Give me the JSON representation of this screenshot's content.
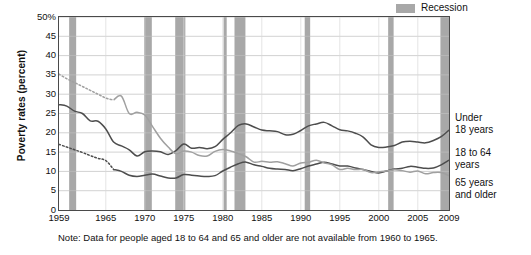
{
  "figure": {
    "y_axis_title": "Poverty rates (percent)",
    "footnote": "Note: Data for people aged 18 to 64 and 65 and older are not available from 1960 to 1965."
  },
  "legend": {
    "recession_label": "Recession",
    "recession_color": "#a8a8a8"
  },
  "series_labels": {
    "under18": "Under\n18 years",
    "age18to64": "18 to 64\nyears",
    "age65plus": "65 years\nand older"
  },
  "chart_data": {
    "type": "line",
    "title": "",
    "xlabel": "",
    "ylabel": "Poverty rates (percent)",
    "xlim": [
      1959,
      2009
    ],
    "ylim": [
      0,
      50
    ],
    "ytick_labels": [
      "0",
      "5",
      "10",
      "15",
      "20",
      "25",
      "30",
      "35",
      "40",
      "45",
      "50%"
    ],
    "ytick_values": [
      0,
      5,
      10,
      15,
      20,
      25,
      30,
      35,
      40,
      45,
      50
    ],
    "xtick_values": [
      1959,
      1965,
      1970,
      1975,
      1980,
      1985,
      1990,
      1995,
      2000,
      2005,
      2009
    ],
    "xtick_labels": [
      "1959",
      "1965",
      "1970",
      "1975",
      "1980",
      "1985",
      "1990",
      "1995",
      "2000",
      "2005",
      "2009"
    ],
    "grid": "horizontal",
    "legend_position": "top-right",
    "colors": {
      "under18": "#4d4d4d",
      "age18to64": "#4d4d4d",
      "age65plus": "#a0a0a0"
    },
    "series": [
      {
        "name": "Under 18 years",
        "color": "#4d4d4d",
        "style": "solid",
        "x": [
          1959,
          1960,
          1961,
          1962,
          1963,
          1964,
          1965,
          1966,
          1967,
          1968,
          1969,
          1970,
          1971,
          1972,
          1973,
          1974,
          1975,
          1976,
          1977,
          1978,
          1979,
          1980,
          1981,
          1982,
          1983,
          1984,
          1985,
          1986,
          1987,
          1988,
          1989,
          1990,
          1991,
          1992,
          1993,
          1994,
          1995,
          1996,
          1997,
          1998,
          1999,
          2000,
          2001,
          2002,
          2003,
          2004,
          2005,
          2006,
          2007,
          2008,
          2009
        ],
        "values": [
          27.3,
          26.9,
          25.6,
          25.0,
          23.1,
          23.0,
          21.0,
          17.6,
          16.6,
          15.6,
          14.0,
          15.1,
          15.3,
          15.1,
          14.4,
          15.4,
          17.1,
          16.0,
          16.2,
          15.9,
          16.4,
          18.3,
          20.0,
          21.9,
          22.3,
          21.5,
          20.7,
          20.5,
          20.3,
          19.5,
          19.6,
          20.6,
          21.8,
          22.3,
          22.7,
          21.8,
          20.8,
          20.5,
          19.9,
          18.9,
          16.9,
          16.2,
          16.3,
          16.7,
          17.6,
          17.8,
          17.6,
          17.4,
          18.0,
          19.0,
          20.7
        ]
      },
      {
        "name": "18 to 64 years",
        "color": "#4d4d4d",
        "style": "dotted-then-solid",
        "solid_from": 1966,
        "x": [
          1959,
          1960,
          1961,
          1962,
          1963,
          1964,
          1965,
          1966,
          1967,
          1968,
          1969,
          1970,
          1971,
          1972,
          1973,
          1974,
          1975,
          1976,
          1977,
          1978,
          1979,
          1980,
          1981,
          1982,
          1983,
          1984,
          1985,
          1986,
          1987,
          1988,
          1989,
          1990,
          1991,
          1992,
          1993,
          1994,
          1995,
          1996,
          1997,
          1998,
          1999,
          2000,
          2001,
          2002,
          2003,
          2004,
          2005,
          2006,
          2007,
          2008,
          2009
        ],
        "values": [
          17.0,
          16.3,
          15.6,
          14.9,
          14.1,
          13.4,
          12.8,
          10.5,
          10.0,
          9.0,
          8.7,
          9.0,
          9.3,
          8.8,
          8.3,
          8.3,
          9.2,
          9.0,
          8.8,
          8.7,
          8.9,
          10.1,
          11.1,
          12.0,
          12.4,
          11.7,
          11.3,
          10.8,
          10.6,
          10.5,
          10.2,
          10.7,
          11.4,
          11.9,
          12.4,
          11.9,
          11.4,
          11.4,
          10.9,
          10.5,
          10.0,
          9.6,
          10.1,
          10.6,
          10.8,
          11.3,
          11.1,
          10.8,
          10.9,
          11.7,
          12.9
        ]
      },
      {
        "name": "65 years and older",
        "color": "#a0a0a0",
        "style": "dotted-then-solid",
        "solid_from": 1966,
        "x": [
          1959,
          1960,
          1961,
          1962,
          1963,
          1964,
          1965,
          1966,
          1967,
          1968,
          1969,
          1970,
          1971,
          1972,
          1973,
          1974,
          1975,
          1976,
          1977,
          1978,
          1979,
          1980,
          1981,
          1982,
          1983,
          1984,
          1985,
          1986,
          1987,
          1988,
          1989,
          1990,
          1991,
          1992,
          1993,
          1994,
          1995,
          1996,
          1997,
          1998,
          1999,
          2000,
          2001,
          2002,
          2003,
          2004,
          2005,
          2006,
          2007,
          2008,
          2009
        ],
        "values": [
          35.2,
          34.0,
          33.0,
          32.0,
          31.0,
          30.0,
          29.0,
          28.5,
          29.5,
          25.0,
          25.3,
          24.6,
          21.6,
          18.6,
          16.3,
          14.6,
          15.3,
          15.0,
          14.1,
          14.0,
          15.2,
          15.7,
          15.3,
          14.6,
          13.8,
          12.4,
          12.6,
          12.4,
          12.5,
          12.0,
          11.4,
          12.2,
          12.4,
          12.9,
          12.2,
          11.7,
          10.5,
          10.8,
          10.5,
          10.5,
          9.7,
          9.9,
          10.1,
          10.4,
          10.2,
          9.8,
          10.1,
          9.4,
          9.7,
          9.7,
          8.9
        ]
      }
    ],
    "recessions": [
      {
        "start": 1960.3,
        "end": 1961.2
      },
      {
        "start": 1969.9,
        "end": 1970.9
      },
      {
        "start": 1973.9,
        "end": 1975.2
      },
      {
        "start": 1980.1,
        "end": 1980.5
      },
      {
        "start": 1981.5,
        "end": 1982.9
      },
      {
        "start": 1990.5,
        "end": 1991.2
      },
      {
        "start": 2001.2,
        "end": 2001.9
      },
      {
        "start": 2007.9,
        "end": 2009.4
      }
    ]
  }
}
